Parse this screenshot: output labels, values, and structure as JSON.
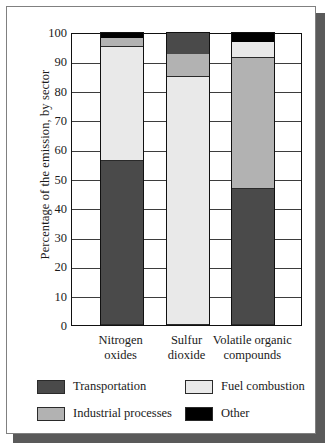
{
  "chart_data": {
    "type": "bar",
    "subtype": "100% stacked column",
    "title": "",
    "xlabel": "",
    "ylabel": "Percentage of the emission, by sector",
    "ylim": [
      0,
      100
    ],
    "yticks": [
      0,
      10,
      20,
      30,
      40,
      50,
      60,
      70,
      80,
      90,
      100
    ],
    "grid": true,
    "legend_position": "bottom",
    "categories": [
      "Nitrogen\noxides",
      "Sulfur\ndioxide",
      "Volatile organic\ncompounds"
    ],
    "series": [
      {
        "name": "Transportation",
        "color": "#4a4a4a",
        "values": [
          56.0,
          7.5,
          46.5
        ]
      },
      {
        "name": "Fuel combustion",
        "color": "#e9e9e9",
        "values": [
          39.0,
          84.5,
          5.5
        ]
      },
      {
        "name": "Industrial processes",
        "color": "#b2b2b2",
        "values": [
          3.0,
          8.0,
          44.5
        ]
      },
      {
        "name": "Other",
        "color": "#000000",
        "values": [
          2.0,
          0.0,
          3.5
        ]
      }
    ],
    "stack_order_bottom_to_top": {
      "Nitrogen oxides": [
        "Transportation",
        "Fuel combustion",
        "Industrial processes",
        "Other"
      ],
      "Sulfur dioxide": [
        "Fuel combustion",
        "Industrial processes",
        "Transportation"
      ],
      "Volatile organic compounds": [
        "Transportation",
        "Industrial processes",
        "Fuel combustion",
        "Other"
      ]
    }
  },
  "legend": {
    "items": [
      {
        "label": "Transportation",
        "color": "#4a4a4a"
      },
      {
        "label": "Fuel combustion",
        "color": "#e9e9e9"
      },
      {
        "label": "Industrial processes",
        "color": "#b2b2b2"
      },
      {
        "label": "Other",
        "color": "#000000"
      }
    ]
  },
  "colors": {
    "frame_border": "#808080",
    "shadow": "#5a5a5a",
    "axis": "#111111",
    "gridline": "#3d3d3d",
    "background": "#ffffff"
  }
}
